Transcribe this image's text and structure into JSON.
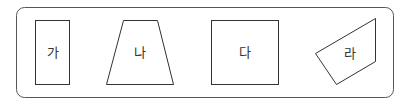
{
  "shapes": [
    {
      "id": "ga",
      "label": "가",
      "kind": "rectangle"
    },
    {
      "id": "na",
      "label": "나",
      "kind": "trapezoid"
    },
    {
      "id": "da",
      "label": "다",
      "kind": "square"
    },
    {
      "id": "ra",
      "label": "라",
      "kind": "quadrilateral"
    }
  ],
  "colors": {
    "stroke": "#333333",
    "frame": "#555555",
    "background": "#ffffff"
  }
}
